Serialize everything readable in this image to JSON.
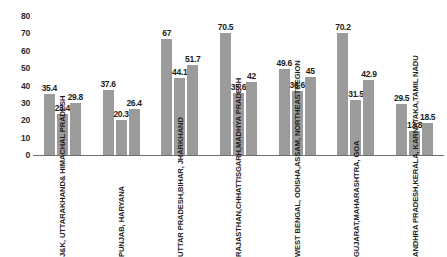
{
  "chart_data": {
    "type": "bar",
    "title": "",
    "subtitle": "",
    "xlabel": "",
    "ylabel": "",
    "ylim": [
      0,
      80
    ],
    "yticks": [
      0,
      10,
      20,
      30,
      40,
      50,
      60,
      70,
      80
    ],
    "grid": false,
    "legend": "none",
    "bar_color": "#9b9b9b",
    "axis_color": "#6f6f6f",
    "label_color": "#1d1d1d",
    "categories": [
      "J&K, UTTARAKHAND & HIMACHAL PRADESH",
      "PUNJAB, HARYANA",
      "UTTAR PRADESH, BIHAR, JHARKHAND",
      "RAJASTHAN, CHHATTISGARH, MADHYA PRADESH",
      "WEST BENGAL, ODISHA, ASSAM, NORTHEAST REGION",
      "GUJARAT, MAHARASHTRA, GOA",
      "ANDHRA PRADESH, KERALA, KARNATAKA, TAMIL NADU"
    ],
    "category_lines": [
      [
        "J&K, UTTARAKHAND",
        "& HIMACHAL PRADESH"
      ],
      [
        "PUNJAB, HARYANA"
      ],
      [
        "UTTAR PRADESH,",
        "BIHAR, JHARKHAND"
      ],
      [
        "RAJASTHAN,",
        "CHHATTISGARH,",
        "MADHYA PRADESH"
      ],
      [
        "WEST BENGAL, ODISHA,",
        "ASSAM, NORTHEAST",
        "REGION"
      ],
      [
        "GUJARAT,",
        "MAHARASHTRA, GOA"
      ],
      [
        "ANDHRA PRADESH,",
        "KERALA, KARNATAKA,",
        "TAMIL NADU"
      ]
    ],
    "series": [
      {
        "name": "series-1",
        "values": [
          35.4,
          37.6,
          67,
          70.5,
          49.6,
          70.2,
          29.5
        ]
      },
      {
        "name": "series-2",
        "values": [
          23.4,
          20.3,
          44.1,
          35.6,
          36.6,
          31.5,
          13.8
        ]
      },
      {
        "name": "series-3",
        "values": [
          29.8,
          26.4,
          51.7,
          42,
          45,
          42.9,
          18.5
        ]
      }
    ],
    "value_labels": [
      [
        "35.4",
        "23.4",
        "29.8"
      ],
      [
        "37.6",
        "20.3",
        "26.4"
      ],
      [
        "67",
        "44.1",
        "51.7"
      ],
      [
        "70.5",
        "35.6",
        "42"
      ],
      [
        "49.6",
        "36.6",
        "45"
      ],
      [
        "70.2",
        "31.5",
        "42.9"
      ],
      [
        "29.5",
        "13.8",
        "18.5"
      ]
    ]
  }
}
